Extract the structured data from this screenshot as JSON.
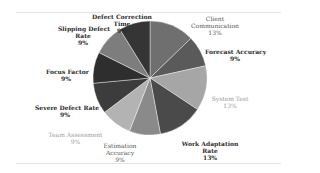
{
  "chart_data": {
    "type": "pie",
    "title": "",
    "center": [
      150,
      78
    ],
    "radius": 57,
    "start_angle_deg": -90,
    "slices": [
      {
        "label": "Client Communication",
        "value": 13,
        "pct_label": "13%",
        "color": "#6f6f6f"
      },
      {
        "label": "Forecast Accuracy",
        "value": 9,
        "pct_label": "9%",
        "color": "#5a5a5a"
      },
      {
        "label": "System Test",
        "value": 13,
        "pct_label": "13%",
        "color": "#a6a6a6"
      },
      {
        "label": "Work Adaptation Rate",
        "value": 13,
        "pct_label": "13%",
        "color": "#4a4a4a"
      },
      {
        "label": "Estimation Accuracy",
        "value": 9,
        "pct_label": "9%",
        "color": "#8a8a8a"
      },
      {
        "label": "Team Assessment",
        "value": 9,
        "pct_label": "9%",
        "color": "#b3b3b3"
      },
      {
        "label": "Severe Defect Rate",
        "value": 9,
        "pct_label": "9%",
        "color": "#3c3c3c"
      },
      {
        "label": "Focus Factor",
        "value": 9,
        "pct_label": "9%",
        "color": "#2e2e2e"
      },
      {
        "label": "Slipping Defect Rate",
        "value": 9,
        "pct_label": "9%",
        "color": "#7d7d7d"
      },
      {
        "label": "Defect Correction Time",
        "value": 9,
        "pct_label": "9%",
        "color": "#353535"
      }
    ],
    "legend": "none (data labels outside slices)"
  },
  "labels": {
    "client_communication": {
      "l1": "Client",
      "l2": "Communication",
      "l3": "13%"
    },
    "forecast_accuracy": {
      "l1": "Forecast Accuracy",
      "l2": "9%"
    },
    "system_test": {
      "l1": "System Test",
      "l2": "13%"
    },
    "work_adaptation_rate": {
      "l1": "Work Adaptation",
      "l2": "Rate",
      "l3": "13%"
    },
    "estimation_accuracy": {
      "l1": "Estimation",
      "l2": "Accuracy",
      "l3": "9%"
    },
    "team_assessment": {
      "l1": "Team Assessment",
      "l2": "9%"
    },
    "severe_defect_rate": {
      "l1": "Severe Defect Rate",
      "l2": "9%"
    },
    "focus_factor": {
      "l1": "Focus Factor",
      "l2": "9%"
    },
    "slipping_defect_rate": {
      "l1": "Slipping Defect",
      "l2": "Rate",
      "l3": "9%"
    },
    "defect_correction_time": {
      "l1": "Defect Correction",
      "l2": "Time",
      "l3": "9%"
    }
  }
}
